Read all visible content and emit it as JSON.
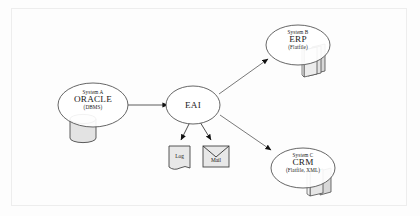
{
  "diagram": {
    "background_color": "#fdfdfd",
    "frame_color": "#ededed",
    "stroke_color": "#555555",
    "fill_shape_color": "#e6e6e6",
    "text_color": "#1a1a1a"
  },
  "nodes": {
    "system_a": {
      "type": "ellipse",
      "line1": "System A",
      "line2": "ORACLE",
      "line3": "(DBMS)",
      "icon": "database-cylinder-icon"
    },
    "eai": {
      "type": "ellipse",
      "label": "EAI"
    },
    "system_b": {
      "type": "ellipse",
      "line1": "System B",
      "line2": "ERP",
      "line3": "(Flatfile)",
      "icon": "document-stack-icon"
    },
    "system_c": {
      "type": "ellipse",
      "line1": "System C",
      "line2": "CRM",
      "line3": "(Flatfile, XML)",
      "icon": "document-stack-icon"
    },
    "log": {
      "type": "note",
      "label": "Log",
      "icon": "log-note-icon"
    },
    "mail": {
      "type": "envelope",
      "label": "Mail",
      "icon": "mail-envelope-icon"
    }
  },
  "edges": [
    {
      "name": "edge-system-a-to-eai",
      "from": "system_a",
      "to": "eai",
      "arrow": "single"
    },
    {
      "name": "edge-eai-to-system-b",
      "from": "eai",
      "to": "system_b",
      "arrow": "single"
    },
    {
      "name": "edge-eai-to-system-c",
      "from": "eai",
      "to": "system_c",
      "arrow": "single"
    },
    {
      "name": "edge-eai-to-log",
      "from": "eai",
      "to": "log",
      "arrow": "single"
    },
    {
      "name": "edge-eai-to-mail",
      "from": "eai",
      "to": "mail",
      "arrow": "single"
    }
  ]
}
